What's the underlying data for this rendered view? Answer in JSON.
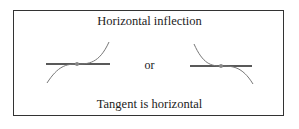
{
  "diagram": {
    "title": "Horizontal inflection",
    "connector": "or",
    "caption": "Tangent is horizontal",
    "figures": [
      {
        "name": "increasing-inflection",
        "tangent": "horizontal",
        "direction": "rising"
      },
      {
        "name": "decreasing-inflection",
        "tangent": "horizontal",
        "direction": "falling"
      }
    ],
    "colors": {
      "line": "#222222",
      "curve": "#777777",
      "dot": "#888888",
      "border": "#333333"
    }
  }
}
